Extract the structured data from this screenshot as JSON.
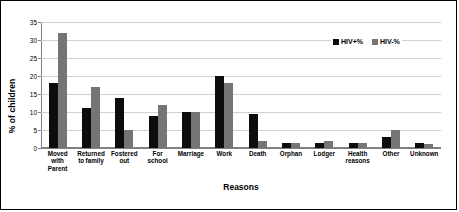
{
  "chart_data": {
    "type": "bar",
    "title": "",
    "xlabel": "Reasons",
    "ylabel": "% of children",
    "ylim": [
      0,
      35
    ],
    "yticks": [
      0,
      5,
      10,
      15,
      20,
      25,
      30,
      35
    ],
    "grid": true,
    "legend_position": "top-right",
    "categories": [
      "Moved with Parent",
      "Returned to family",
      "Fostered out",
      "For school",
      "Marriage",
      "Work",
      "Death",
      "Orphan",
      "Lodger",
      "Health reasons",
      "Other",
      "Unknown"
    ],
    "series": [
      {
        "name": "HIV+%",
        "color": "#0d0d0d",
        "values": [
          18,
          11,
          14,
          9,
          10,
          20,
          9.5,
          1.5,
          1.5,
          1.5,
          3,
          1.5
        ]
      },
      {
        "name": "HIV-%",
        "color": "#757575",
        "values": [
          32,
          17,
          5,
          12,
          10,
          18,
          2,
          1.5,
          2,
          1.5,
          5,
          1
        ]
      }
    ]
  },
  "legend": {
    "items": [
      {
        "label": "HIV+%"
      },
      {
        "label": "HIV-%"
      }
    ]
  },
  "axes": {
    "y_title": "% of children",
    "x_title": "Reasons"
  }
}
